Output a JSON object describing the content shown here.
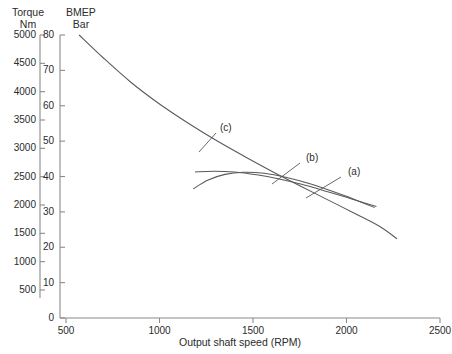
{
  "chart_data": {
    "type": "line",
    "title": "",
    "xlabel": "Output shaft speed (RPM)",
    "ylabel": "BMEP Bar",
    "ylabel_secondary": "Torque Nm",
    "xlim": [
      500,
      2500
    ],
    "ylim": [
      0,
      80
    ],
    "ylim_secondary": [
      500,
      5000
    ],
    "grid": false,
    "legend": "inline-annotations",
    "xticks": [
      500,
      1000,
      1500,
      2000,
      2500
    ],
    "yticks": [
      0,
      10,
      20,
      30,
      40,
      50,
      60,
      70,
      80
    ],
    "yticks_secondary": [
      500,
      1000,
      1500,
      2000,
      2500,
      3000,
      3500,
      4000,
      4500,
      5000
    ],
    "series": [
      {
        "name": "(a)",
        "x": [
          1180,
          1260,
          1350,
          1450,
          1560,
          1680,
          1800,
          1920,
          2040,
          2150
        ],
        "values": [
          36.5,
          39.0,
          40.6,
          41.2,
          40.9,
          39.7,
          38.0,
          35.9,
          33.6,
          31.2
        ]
      },
      {
        "name": "(b)",
        "x": [
          1190,
          1290,
          1400,
          1520,
          1640,
          1760,
          1880,
          2000,
          2110,
          2160
        ],
        "values": [
          41.3,
          41.5,
          41.3,
          40.5,
          39.3,
          37.8,
          36.0,
          34.1,
          32.3,
          31.5
        ]
      },
      {
        "name": "(c)",
        "x": [
          570,
          700,
          850,
          1000,
          1150,
          1300,
          1450,
          1600,
          1750,
          1900,
          2050,
          2180,
          2270
        ],
        "values": [
          80.0,
          73.5,
          66.5,
          60.5,
          55.2,
          50.3,
          45.8,
          41.5,
          37.4,
          33.4,
          29.4,
          25.8,
          22.4
        ]
      }
    ],
    "annotations": [
      {
        "text": "(a)",
        "series": "(a)"
      },
      {
        "text": "(b)",
        "series": "(b)"
      },
      {
        "text": "(c)",
        "series": "(c)"
      }
    ]
  },
  "axes": {
    "torque": {
      "name": "Torque",
      "unit": "Nm"
    },
    "bmep": {
      "name": "BMEP",
      "unit": "Bar"
    }
  },
  "colors": {
    "curve": "#59595c",
    "axis": "#8a8a8a",
    "text": "#2b2b2b",
    "background": "#ffffff"
  }
}
